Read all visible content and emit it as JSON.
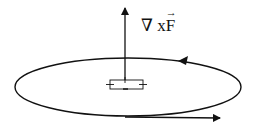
{
  "diagram": {
    "type": "curl illustration",
    "label": {
      "nabla": "∇",
      "times": "x",
      "vector": "F",
      "vector_arrow": "→"
    },
    "elements": {
      "curl_arrow": {
        "direction": "up"
      },
      "loop": {
        "shape": "ellipse",
        "orientation": "counterclockwise (viewed from above)"
      },
      "small_loop": {
        "shape": "rectangle",
        "marks": 4
      },
      "tangent_arrow": {
        "direction": "right"
      }
    },
    "colors": {
      "stroke": "#111111",
      "background": "#ffffff"
    }
  }
}
